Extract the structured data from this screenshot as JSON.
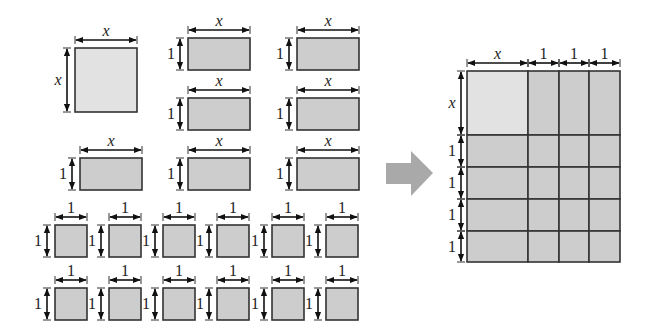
{
  "diagram": {
    "colors": {
      "x2_tile": "#e2e2e2",
      "tile": "#cdcdcd",
      "border": "#333333",
      "arrow": "#a9a9a9"
    },
    "labels": {
      "x": "x",
      "one": "1"
    },
    "left": {
      "x2_tiles": 1,
      "x_tiles": 7,
      "unit_tiles": 12
    },
    "right": {
      "top_labels": [
        "x",
        "1",
        "1",
        "1"
      ],
      "side_labels": [
        "x",
        "1",
        "1",
        "1",
        "1"
      ]
    }
  }
}
